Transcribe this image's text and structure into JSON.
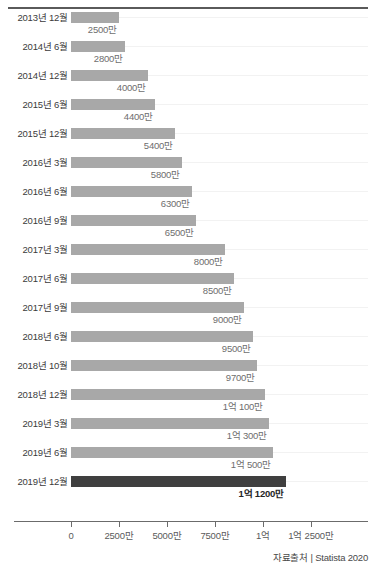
{
  "chart_data": {
    "type": "bar",
    "orientation": "horizontal",
    "title": "",
    "xlabel": "",
    "ylabel": "",
    "xlim": [
      0,
      137500000
    ],
    "grid": true,
    "legend": "none",
    "axis": {
      "tick_labels": [
        "0",
        "2500만",
        "5000만",
        "7500만",
        "1억",
        "1억 2500만"
      ],
      "tick_values": [
        0,
        25000000,
        50000000,
        75000000,
        100000000,
        125000000
      ]
    },
    "categories": [
      "2013년 12월",
      "2014년 6월",
      "2014년 12월",
      "2015년 6월",
      "2015년 12월",
      "2016년 3월",
      "2016년 6월",
      "2016년 9월",
      "2017년 3월",
      "2017년 6월",
      "2017년 9월",
      "2018년 6월",
      "2018년 10월",
      "2018년 12월",
      "2019년 3월",
      "2019년 6월",
      "2019년 12월"
    ],
    "values": [
      25000000,
      28000000,
      40000000,
      44000000,
      54000000,
      58000000,
      63000000,
      65000000,
      80000000,
      85000000,
      90000000,
      95000000,
      97000000,
      101000000,
      103000000,
      105000000,
      112000000
    ],
    "value_labels": [
      "2500만",
      "2800만",
      "4000만",
      "4400만",
      "5400만",
      "5800만",
      "6300만",
      "6500만",
      "8000만",
      "8500만",
      "9000만",
      "9500만",
      "9700만",
      "1억 100만",
      "1억 300만",
      "1억 500만",
      "1억 1200만"
    ],
    "highlight_index": 16,
    "colors": {
      "bar": "#a8a8a8",
      "bar_highlight": "#3f3f3f",
      "axis": "#6b6b6b",
      "grid": "#f2f2f2",
      "label": "#3b3b3b",
      "value_label": "#6e6e6e"
    }
  },
  "footer": {
    "source": "자료출처 | Statista 2020"
  }
}
